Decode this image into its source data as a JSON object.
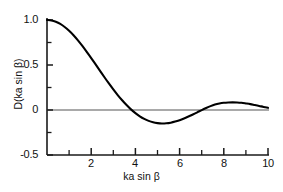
{
  "chart_data": {
    "type": "line",
    "title": "",
    "xlabel": "ka sin β",
    "ylabel": "D(ka sin β)",
    "xlim": [
      0,
      10
    ],
    "ylim": [
      -0.5,
      1.0
    ],
    "grid": false,
    "legend": null,
    "x_ticks_major": [
      2,
      4,
      6,
      8,
      10
    ],
    "x_ticklabels": [
      "2",
      "4",
      "6",
      "8",
      "10"
    ],
    "x_ticks_minor": [
      0,
      1,
      3,
      5,
      7,
      9
    ],
    "y_ticks_major": [
      1.0,
      0.5,
      0,
      -0.5
    ],
    "y_ticklabels": [
      "1.0",
      "0.5",
      "0",
      "-0.5"
    ],
    "y_ticks_minor": [
      0.75,
      0.25,
      -0.25
    ],
    "zero_line": 0,
    "series": [
      {
        "name": "D(ka sin β)",
        "color": "#000000",
        "x": [
          0.0,
          0.2,
          0.4,
          0.6,
          0.8,
          1.0,
          1.2,
          1.4,
          1.6,
          1.8,
          2.0,
          2.2,
          2.4,
          2.6,
          2.8,
          3.0,
          3.2,
          3.4,
          3.6,
          3.8,
          4.0,
          4.2,
          4.4,
          4.6,
          4.8,
          5.0,
          5.2,
          5.4,
          5.6,
          5.8,
          6.0,
          6.2,
          6.4,
          6.6,
          6.8,
          7.0,
          7.2,
          7.4,
          7.6,
          7.8,
          8.0,
          8.2,
          8.4,
          8.6,
          8.8,
          9.0,
          9.2,
          9.4,
          9.6,
          9.8,
          10.0
        ],
        "y": [
          1.0,
          0.995,
          0.98,
          0.956,
          0.922,
          0.88,
          0.831,
          0.774,
          0.712,
          0.645,
          0.577,
          0.506,
          0.435,
          0.364,
          0.295,
          0.229,
          0.166,
          0.108,
          0.055,
          0.007,
          -0.034,
          -0.07,
          -0.099,
          -0.121,
          -0.137,
          -0.146,
          -0.15,
          -0.148,
          -0.141,
          -0.129,
          -0.113,
          -0.094,
          -0.073,
          -0.05,
          -0.026,
          -0.001,
          0.022,
          0.043,
          0.06,
          0.072,
          0.08,
          0.084,
          0.085,
          0.084,
          0.08,
          0.073,
          0.065,
          0.055,
          0.045,
          0.034,
          0.024
        ]
      }
    ],
    "annotations": [
      {
        "text": "zero axis line drawn across full plot width at y = 0"
      }
    ]
  },
  "axes": {
    "x_title": "ka sin β",
    "y_title": "D(ka sin β)",
    "y_labels": {
      "top": "1.0",
      "upper_mid": "0.5",
      "zero": "0",
      "bottom": "-0.5"
    },
    "x_labels": {
      "t2": "2",
      "t4": "4",
      "t6": "6",
      "t8": "8",
      "t10": "10"
    }
  },
  "style": {
    "background": "#ffffff",
    "axis_color": "#1a1a1a",
    "curve_color": "#000000"
  }
}
